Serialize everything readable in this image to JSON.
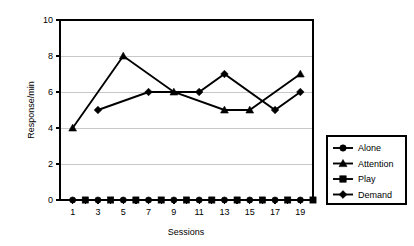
{
  "chart_data": {
    "type": "line",
    "title": "",
    "xlabel": "Sessions",
    "ylabel": "Response/min",
    "xlim": [
      0,
      20
    ],
    "ylim": [
      0,
      10
    ],
    "grid": true,
    "legend_position": "right",
    "y_ticks": [
      0,
      2,
      4,
      6,
      8,
      10
    ],
    "y_tick_labels": [
      "0",
      "2",
      "4",
      "6",
      "8",
      "10"
    ],
    "x_ticks": [
      1,
      2,
      3,
      4,
      5,
      6,
      7,
      8,
      9,
      10,
      11,
      12,
      13,
      14,
      15,
      16,
      17,
      18,
      19
    ],
    "x_tick_labels": [
      "1",
      "3",
      "5",
      "7",
      "9",
      "11",
      "13",
      "15",
      "17",
      "19"
    ],
    "x_labeled_ticks": [
      1,
      3,
      5,
      7,
      9,
      11,
      13,
      15,
      17,
      19
    ],
    "series": [
      {
        "name": "Alone",
        "marker": "circle",
        "x": [
          1,
          3,
          5,
          7,
          9,
          11,
          13,
          15,
          17,
          19
        ],
        "values": [
          0,
          0,
          0,
          0,
          0,
          0,
          0,
          0,
          0,
          0
        ]
      },
      {
        "name": "Attention",
        "marker": "triangle",
        "x": [
          1,
          5,
          9,
          13,
          15,
          19
        ],
        "values": [
          4,
          8,
          6,
          5,
          5,
          7
        ]
      },
      {
        "name": "Play",
        "marker": "square",
        "x": [
          2,
          4,
          6,
          8,
          10,
          12,
          14,
          16,
          18,
          20
        ],
        "values": [
          0,
          0,
          0,
          0,
          0,
          0,
          0,
          0,
          0,
          0
        ]
      },
      {
        "name": "Demand",
        "marker": "diamond",
        "x": [
          3,
          7,
          11,
          13,
          17,
          19
        ],
        "values": [
          5,
          6,
          6,
          7,
          5,
          6
        ]
      }
    ]
  },
  "legend": {
    "entries": [
      {
        "label": "Alone",
        "marker": "circle"
      },
      {
        "label": "Attention",
        "marker": "triangle"
      },
      {
        "label": "Play",
        "marker": "square"
      },
      {
        "label": "Demand",
        "marker": "diamond"
      }
    ]
  },
  "axes": {
    "y_title": "Response/min",
    "x_title": "Sessions"
  },
  "colors": {
    "ink": "#000000",
    "grid": "#c8c8c8",
    "background": "#ffffff"
  }
}
